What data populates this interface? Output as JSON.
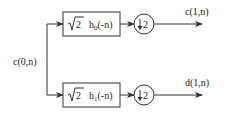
{
  "diagram": {
    "input": {
      "label": "c(0,n)"
    },
    "branches": [
      {
        "name": "lowpass",
        "filter": {
          "gain": "√2",
          "func": "h",
          "subscript": "0",
          "arg": "(-n)"
        },
        "downsampler": {
          "symbol": "↓",
          "factor": "2"
        },
        "output": {
          "label": "c(1,n)"
        }
      },
      {
        "name": "highpass",
        "filter": {
          "gain": "√2",
          "func": "h",
          "subscript": "1",
          "arg": "(-n)"
        },
        "downsampler": {
          "symbol": "↓",
          "factor": "2"
        },
        "output": {
          "label": "d(1,n)"
        }
      }
    ],
    "colors": {
      "stroke": "#333333",
      "text": "#222222",
      "background": "#ffffff"
    }
  }
}
